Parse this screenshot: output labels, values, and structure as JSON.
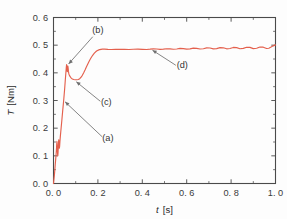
{
  "chart_data": {
    "type": "line",
    "title": "",
    "subtitle": "",
    "xlabel": "t  [s]",
    "xlabel_symbol": "t",
    "xlabel_unit": "[s]",
    "ylabel": "T  [Nm]",
    "ylabel_symbol": "T",
    "ylabel_unit": "[Nm]",
    "xlim": [
      0.0,
      1.0
    ],
    "ylim": [
      0.0,
      0.6
    ],
    "xticks": [
      0.0,
      0.2,
      0.4,
      0.6,
      0.8,
      1.0
    ],
    "xticklabels": [
      "0. 0",
      "0. 2",
      "0. 4",
      "0. 6",
      "0. 8",
      "1. 0"
    ],
    "yticks": [
      0.0,
      0.1,
      0.2,
      0.3,
      0.4,
      0.5,
      0.6
    ],
    "yticklabels": [
      "0. 0",
      "0. 1",
      "0. 2",
      "0. 3",
      "0. 4",
      "0. 5",
      "0. 6"
    ],
    "x_minor_ticks": [
      0.1,
      0.3,
      0.5,
      0.7,
      0.9
    ],
    "y_minor_ticks": [
      0.05,
      0.15,
      0.25,
      0.35,
      0.45,
      0.55
    ],
    "grid": false,
    "legend": null,
    "legend_position": "none",
    "series": [
      {
        "name": "torque",
        "color": "#e4604d",
        "linewidth": 1.15,
        "points": [
          [
            0.0,
            0.0
          ],
          [
            0.004,
            0.03
          ],
          [
            0.008,
            0.07
          ],
          [
            0.011,
            0.098
          ],
          [
            0.013,
            0.12
          ],
          [
            0.0145,
            0.142
          ],
          [
            0.0155,
            0.152
          ],
          [
            0.0165,
            0.14
          ],
          [
            0.0175,
            0.12
          ],
          [
            0.0185,
            0.106
          ],
          [
            0.0195,
            0.1
          ],
          [
            0.0205,
            0.112
          ],
          [
            0.0215,
            0.13
          ],
          [
            0.0225,
            0.148
          ],
          [
            0.0235,
            0.158
          ],
          [
            0.0245,
            0.15
          ],
          [
            0.0255,
            0.136
          ],
          [
            0.0265,
            0.128
          ],
          [
            0.0275,
            0.134
          ],
          [
            0.029,
            0.152
          ],
          [
            0.031,
            0.172
          ],
          [
            0.034,
            0.198
          ],
          [
            0.038,
            0.232
          ],
          [
            0.042,
            0.268
          ],
          [
            0.046,
            0.302
          ],
          [
            0.05,
            0.34
          ],
          [
            0.053,
            0.372
          ],
          [
            0.0555,
            0.398
          ],
          [
            0.0575,
            0.418
          ],
          [
            0.059,
            0.43
          ],
          [
            0.06,
            0.425
          ],
          [
            0.061,
            0.412
          ],
          [
            0.0622,
            0.404
          ],
          [
            0.0634,
            0.414
          ],
          [
            0.0646,
            0.424
          ],
          [
            0.0658,
            0.418
          ],
          [
            0.0672,
            0.406
          ],
          [
            0.0688,
            0.398
          ],
          [
            0.0706,
            0.393
          ],
          [
            0.073,
            0.389
          ],
          [
            0.076,
            0.385
          ],
          [
            0.08,
            0.381
          ],
          [
            0.085,
            0.378
          ],
          [
            0.091,
            0.376
          ],
          [
            0.098,
            0.375
          ],
          [
            0.105,
            0.375
          ],
          [
            0.112,
            0.376
          ],
          [
            0.118,
            0.379
          ],
          [
            0.124,
            0.384
          ],
          [
            0.13,
            0.391
          ],
          [
            0.136,
            0.4
          ],
          [
            0.142,
            0.41
          ],
          [
            0.148,
            0.421
          ],
          [
            0.154,
            0.431
          ],
          [
            0.16,
            0.441
          ],
          [
            0.166,
            0.45
          ],
          [
            0.172,
            0.458
          ],
          [
            0.178,
            0.465
          ],
          [
            0.184,
            0.471
          ],
          [
            0.19,
            0.476
          ],
          [
            0.196,
            0.48
          ],
          [
            0.202,
            0.482
          ],
          [
            0.208,
            0.484
          ],
          [
            0.214,
            0.485
          ],
          [
            0.22,
            0.4855
          ],
          [
            0.23,
            0.4858
          ],
          [
            0.245,
            0.485
          ],
          [
            0.26,
            0.4845
          ],
          [
            0.28,
            0.4848
          ],
          [
            0.3,
            0.4852
          ],
          [
            0.32,
            0.4848
          ],
          [
            0.34,
            0.4845
          ],
          [
            0.36,
            0.4852
          ],
          [
            0.38,
            0.4858
          ],
          [
            0.4,
            0.485
          ],
          [
            0.42,
            0.4845
          ],
          [
            0.435,
            0.4855
          ],
          [
            0.45,
            0.4868
          ],
          [
            0.465,
            0.486
          ],
          [
            0.48,
            0.4848
          ],
          [
            0.495,
            0.4856
          ],
          [
            0.51,
            0.4872
          ],
          [
            0.525,
            0.4866
          ],
          [
            0.54,
            0.4852
          ],
          [
            0.555,
            0.4862
          ],
          [
            0.57,
            0.4882
          ],
          [
            0.585,
            0.4874
          ],
          [
            0.6,
            0.4856
          ],
          [
            0.615,
            0.4868
          ],
          [
            0.63,
            0.4894
          ],
          [
            0.645,
            0.4886
          ],
          [
            0.66,
            0.486
          ],
          [
            0.675,
            0.4872
          ],
          [
            0.69,
            0.4902
          ],
          [
            0.705,
            0.4896
          ],
          [
            0.72,
            0.4864
          ],
          [
            0.735,
            0.4876
          ],
          [
            0.75,
            0.491
          ],
          [
            0.765,
            0.4904
          ],
          [
            0.78,
            0.4868
          ],
          [
            0.795,
            0.488
          ],
          [
            0.81,
            0.4918
          ],
          [
            0.825,
            0.4912
          ],
          [
            0.84,
            0.4872
          ],
          [
            0.855,
            0.4884
          ],
          [
            0.87,
            0.4926
          ],
          [
            0.885,
            0.492
          ],
          [
            0.9,
            0.4876
          ],
          [
            0.915,
            0.4888
          ],
          [
            0.93,
            0.4934
          ],
          [
            0.945,
            0.4928
          ],
          [
            0.96,
            0.488
          ],
          [
            0.97,
            0.489
          ],
          [
            0.98,
            0.493
          ],
          [
            0.99,
            0.4975
          ],
          [
            1.0,
            0.501
          ]
        ]
      }
    ],
    "annotations": [
      {
        "label": "(a)",
        "text_x": 0.245,
        "text_y": 0.155,
        "point_x": 0.0455,
        "point_y": 0.3,
        "name": "annotation-a"
      },
      {
        "label": "(b)",
        "text_x": 0.2,
        "text_y": 0.545,
        "point_x": 0.062,
        "point_y": 0.427,
        "name": "annotation-b"
      },
      {
        "label": "(c)",
        "text_x": 0.238,
        "text_y": 0.285,
        "point_x": 0.0955,
        "point_y": 0.372,
        "name": "annotation-c"
      },
      {
        "label": "(d)",
        "text_x": 0.58,
        "text_y": 0.417,
        "point_x": 0.438,
        "point_y": 0.4855,
        "name": "annotation-d"
      }
    ]
  },
  "colors": {
    "curve": "#e4604d",
    "axis": "#4a4a4a",
    "text": "#333333",
    "leader": "#6f6f6f",
    "background": "#fdfdfd"
  }
}
